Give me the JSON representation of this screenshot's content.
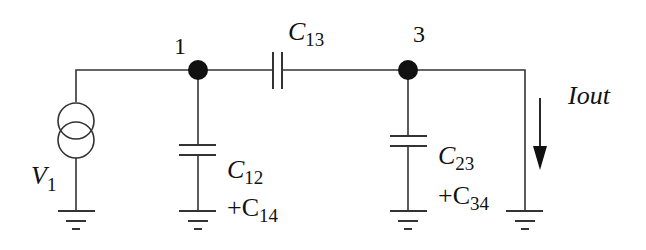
{
  "diagram": {
    "type": "circuit-schematic",
    "colors": {
      "wire": "#333333",
      "node": "#111111",
      "background": "#ffffff"
    },
    "nodes": [
      {
        "id": "1",
        "label": "1"
      },
      {
        "id": "3",
        "label": "3"
      }
    ],
    "source": {
      "name": "V",
      "subscript": "1",
      "kind": "current-source"
    },
    "components": {
      "c13": {
        "name": "C",
        "subscript": "13"
      },
      "c12": {
        "name": "C",
        "subscript": "12",
        "plus_name": "+C",
        "plus_subscript": "14"
      },
      "c23": {
        "name": "C",
        "subscript": "23",
        "plus_name": "+C",
        "plus_subscript": "34"
      }
    },
    "output": {
      "label": "Iout",
      "direction": "down"
    }
  }
}
